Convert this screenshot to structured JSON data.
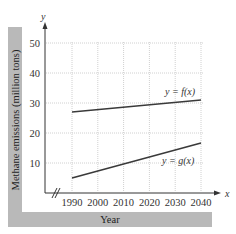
{
  "top_text": "graph of the rate ... graphs of the functions",
  "chart_data": {
    "type": "line",
    "title": "",
    "xlabel": "Year",
    "ylabel": "Methane emissions (million tons)",
    "x_axis_name": "x",
    "y_axis_name": "y",
    "x_ticks": [
      "1990",
      "2000",
      "2010",
      "2020",
      "2030",
      "2040"
    ],
    "y_ticks": [
      "10",
      "20",
      "30",
      "40",
      "50"
    ],
    "xlim": [
      1990,
      2040
    ],
    "ylim": [
      0,
      50
    ],
    "x_axis_break": true,
    "grid": true,
    "series": [
      {
        "name": "y = f(x)",
        "x": [
          1990,
          2040
        ],
        "values": [
          27,
          31
        ],
        "color": "#3a3a3a"
      },
      {
        "name": "y = g(x)",
        "x": [
          1990,
          2040
        ],
        "values": [
          5,
          16.7
        ],
        "color": "#3a3a3a"
      }
    ],
    "annotations": [
      {
        "text": "y = f(x)",
        "near": [
          2040,
          31
        ]
      },
      {
        "text": "y = g(x)",
        "near": [
          2040,
          16.7
        ]
      }
    ]
  },
  "colors": {
    "band": "#b9b9b9",
    "grid": "#d0d0d0",
    "axis": "#333333",
    "line": "#3a3a3a"
  }
}
